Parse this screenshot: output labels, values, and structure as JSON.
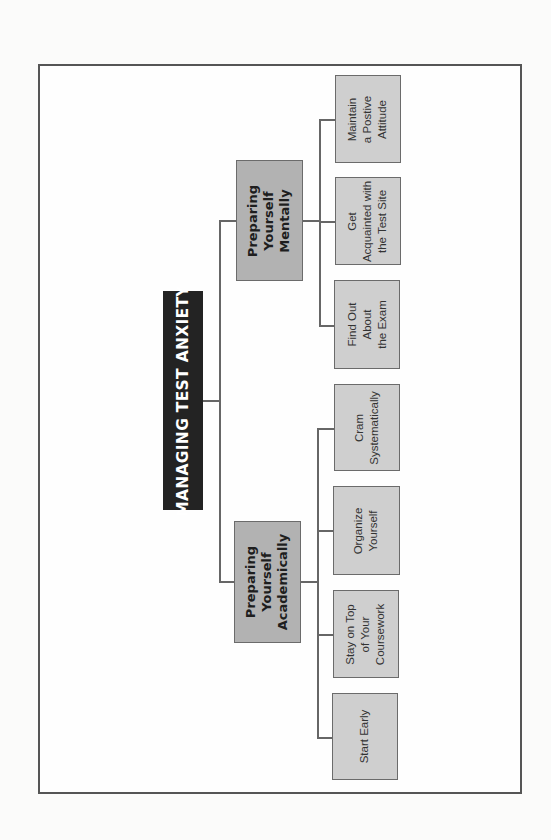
{
  "diagram": {
    "type": "org-chart",
    "orientation": "rotated-90-ccw",
    "root": {
      "label": "MANAGING TEST ANXIETY",
      "color": "#232323"
    },
    "branches": [
      {
        "label": "Preparing\nYourself\nMentally",
        "children": [
          {
            "label": "Maintain\na Postive\nAttitude"
          },
          {
            "label": "Get\nAcquainted with\nthe Test Site"
          },
          {
            "label": "Find Out\nAbout\nthe Exam"
          }
        ]
      },
      {
        "label": "Preparing\nYourself\nAcademically",
        "children": [
          {
            "label": "Cram\nSystematically"
          },
          {
            "label": "Organize\nYourself"
          },
          {
            "label": "Stay on Top\nof Your\nCoursework"
          },
          {
            "label": "Start Early"
          }
        ]
      }
    ],
    "colors": {
      "root_fill": "#232323",
      "branch_fill": "#b2b2b2",
      "leaf_fill": "#cfcfcf",
      "line": "#666666"
    }
  }
}
